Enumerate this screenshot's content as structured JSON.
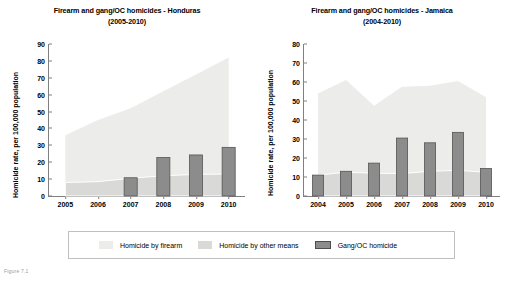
{
  "figure": {
    "caption": "Figure 7.1"
  },
  "legend": {
    "items": [
      {
        "key": "firearm",
        "label": "Homicide by firearm",
        "color": "#ececeb"
      },
      {
        "key": "other",
        "label": "Homicide by other means",
        "color": "#d9d9d7"
      },
      {
        "key": "gang",
        "label": "Gang/OC homicide",
        "color": "#8c8c8c"
      }
    ]
  },
  "chart_data": [
    {
      "id": "honduras",
      "type": "area",
      "title": "Firearm and gang/OC homicides - Honduras",
      "subtitle": "(2005-2010)",
      "xlabel": "",
      "ylabel": "Homicide rate, per 100,000 population",
      "categories": [
        "2005",
        "2006",
        "2007",
        "2008",
        "2009",
        "2010"
      ],
      "yticks": [
        0,
        10,
        20,
        30,
        40,
        50,
        60,
        70,
        80,
        90
      ],
      "ylim": [
        0,
        90
      ],
      "grid": false,
      "legend_position": "bottom",
      "series": [
        {
          "name": "Homicide by other means",
          "type": "area-stacked",
          "color": "#d9d9d7",
          "values": [
            8.0,
            8.5,
            10.5,
            12.0,
            12.8,
            13.0
          ]
        },
        {
          "name": "Homicide by firearm",
          "type": "area-stacked",
          "color": "#ececeb",
          "values": [
            28.0,
            36.5,
            41.5,
            50.0,
            59.2,
            69.0
          ]
        },
        {
          "name": "Gang/OC homicide",
          "type": "bar",
          "color": "#8c8c8c",
          "values": [
            null,
            null,
            10.8,
            22.8,
            24.3,
            28.8
          ]
        }
      ],
      "totals": [
        36.0,
        45.0,
        52.0,
        62.0,
        72.0,
        82.0
      ]
    },
    {
      "id": "jamaica",
      "type": "area",
      "title": "Firearm and gang/OC homicides - Jamaica",
      "subtitle": "(2004-2010)",
      "xlabel": "",
      "ylabel": "Homicide rate, per 100,000 population",
      "categories": [
        "2004",
        "2005",
        "2006",
        "2007",
        "2008",
        "2009",
        "2010"
      ],
      "yticks": [
        0,
        10,
        20,
        30,
        40,
        50,
        60,
        70,
        80
      ],
      "ylim": [
        0,
        80
      ],
      "grid": false,
      "legend_position": "bottom",
      "series": [
        {
          "name": "Homicide by other means",
          "type": "area-stacked",
          "color": "#d9d9d7",
          "values": [
            11.0,
            12.5,
            12.0,
            11.8,
            13.0,
            13.5,
            12.5
          ]
        },
        {
          "name": "Homicide by firearm",
          "type": "area-stacked",
          "color": "#ececeb",
          "values": [
            43.0,
            48.5,
            35.5,
            45.7,
            45.0,
            47.0,
            39.5
          ]
        },
        {
          "name": "Gang/OC homicide",
          "type": "bar",
          "color": "#8c8c8c",
          "values": [
            11.0,
            13.0,
            17.3,
            30.5,
            28.0,
            33.5,
            14.5
          ]
        }
      ],
      "totals": [
        54.0,
        61.0,
        47.5,
        57.5,
        58.0,
        60.5,
        52.0
      ]
    }
  ]
}
